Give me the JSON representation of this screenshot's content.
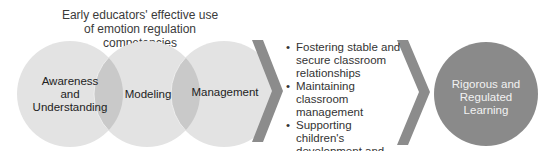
{
  "title": {
    "line1": "Early educators' effective use",
    "line2": "of emotion regulation competencies"
  },
  "competencies": [
    {
      "label_lines": [
        "Awareness",
        "and",
        "Understanding"
      ]
    },
    {
      "label_lines": [
        "Modeling"
      ]
    },
    {
      "label_lines": [
        "Management"
      ]
    }
  ],
  "outcomes": [
    "Fostering stable and secure classroom relationships",
    "Maintaining classroom management",
    "Supporting children's development and learning"
  ],
  "result": {
    "label_lines": [
      "Rigorous and",
      "Regulated",
      "Learning"
    ]
  },
  "colors": {
    "circle_light": "#e3e3e3",
    "circle_overlap": "#c9c9c9",
    "chevron": "#8c8c8c",
    "result_circle": "#8a8a8a",
    "result_text": "#f2f2f2"
  }
}
